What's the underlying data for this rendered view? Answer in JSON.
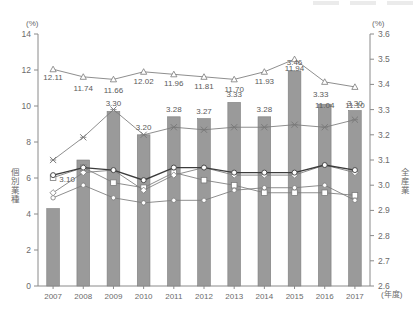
{
  "axes": {
    "left_unit": "(%)",
    "right_unit": "(%)",
    "left_title": "個別業種",
    "right_title": "全産業",
    "x_unit": "(年度)",
    "left_ticks": [
      "0",
      "2",
      "4",
      "6",
      "8",
      "10",
      "12",
      "14"
    ],
    "right_ticks": [
      "2.6",
      "2.7",
      "2.8",
      "2.9",
      "3.0",
      "3.1",
      "3.2",
      "3.3",
      "3.4",
      "3.5",
      "3.6"
    ]
  },
  "chart_data": {
    "type": "bar",
    "title": "",
    "subtitle": "",
    "xlabel": "(年度)",
    "ylabel": "個別業種",
    "y2label": "全産業",
    "ylim": [
      0,
      14
    ],
    "y2lim": [
      2.6,
      3.6
    ],
    "grid": false,
    "legend_position": "top-right",
    "categories": [
      "2007",
      "2008",
      "2009",
      "2010",
      "2011",
      "2012",
      "2013",
      "2014",
      "2015",
      "2016",
      "2017"
    ],
    "series": [
      {
        "name": "個別業種(棒)",
        "type": "bar",
        "axis": "left",
        "marker": "none",
        "values": [
          4.3,
          7.0,
          9.7,
          8.4,
          9.4,
          9.3,
          10.2,
          9.4,
          11.95,
          10.1,
          9.75
        ],
        "labels": [
          "",
          "",
          "",
          "",
          "",
          "",
          "",
          "",
          "",
          "",
          ""
        ]
      },
      {
        "name": "全産業 上位線(△)",
        "type": "line",
        "axis": "right",
        "marker": "triangle",
        "values": [
          3.46,
          3.43,
          3.42,
          3.45,
          3.44,
          3.43,
          3.42,
          3.45,
          3.5,
          3.41,
          3.39
        ],
        "labels": [
          "12.11",
          "11.74",
          "11.66",
          "12.02",
          "11.96",
          "11.81",
          "11.70",
          "11.93",
          "11.94",
          "11.04",
          "11.10"
        ]
      },
      {
        "name": "全産業 ×線",
        "type": "line",
        "axis": "right",
        "marker": "cross",
        "values": [
          3.1,
          3.19,
          3.3,
          3.2,
          3.23,
          3.22,
          3.23,
          3.23,
          3.24,
          3.23,
          3.26
        ],
        "labels": [
          "3.10",
          "",
          "3.30",
          "3.20",
          "3.28",
          "3.27",
          "3.33",
          "3.28",
          "3.46",
          "3.33",
          "3.30"
        ]
      },
      {
        "name": "全産業 □線",
        "type": "line",
        "axis": "right",
        "marker": "square",
        "values": [
          3.03,
          3.07,
          3.01,
          2.99,
          3.05,
          3.02,
          3.0,
          2.97,
          2.97,
          2.97,
          2.96
        ],
        "labels": [
          "",
          "",
          "",
          "",
          "",
          "",
          "",
          "",
          "",
          "",
          ""
        ]
      },
      {
        "name": "全産業 ◇線",
        "type": "line",
        "axis": "right",
        "marker": "diamond",
        "values": [
          2.97,
          3.05,
          3.06,
          2.98,
          3.04,
          3.07,
          3.04,
          3.04,
          3.04,
          3.08,
          3.05
        ],
        "labels": [
          "",
          "",
          "",
          "",
          "",
          "",
          "",
          "",
          "",
          "",
          ""
        ]
      },
      {
        "name": "全産業 ●線(太)",
        "type": "line",
        "axis": "right",
        "marker": "circle",
        "values": [
          3.04,
          3.07,
          3.06,
          3.02,
          3.07,
          3.07,
          3.05,
          3.05,
          3.05,
          3.08,
          3.06
        ],
        "labels": [
          "",
          "",
          "",
          "",
          "",
          "",
          "",
          "",
          "",
          "",
          ""
        ]
      },
      {
        "name": "全産業 ○線(下)",
        "type": "line",
        "axis": "right",
        "marker": "opencircle",
        "values": [
          2.95,
          3.0,
          2.95,
          2.93,
          2.94,
          2.94,
          2.98,
          2.99,
          2.99,
          3.0,
          2.94
        ],
        "labels": [
          "",
          "",
          "",
          "",
          "",
          "",
          "",
          "",
          "",
          "",
          ""
        ]
      }
    ],
    "bar_value_labels": {
      "note": "labels above bars belong to the line series",
      "triangle_labels": [
        "12.11",
        "11.74",
        "11.66",
        "12.02",
        "11.96",
        "11.81",
        "11.70",
        "11.93",
        "11.94",
        "11.04",
        "11.10"
      ],
      "cross_labels": [
        "3.10",
        "",
        "3.30",
        "3.20",
        "3.28",
        "3.27",
        "3.33",
        "3.28",
        "3.46",
        "3.33",
        "3.30"
      ]
    },
    "colors": {
      "bar_fill": "#9a9a9a",
      "bar_stroke": "#7d7d7d",
      "line_gray": "#7a7a7a",
      "line_dark": "#3c3c3c",
      "axis": "#8a8a8a",
      "text": "#5a5a5a"
    }
  },
  "legend": {
    "faint_top_items": [
      "",
      "",
      ""
    ]
  }
}
